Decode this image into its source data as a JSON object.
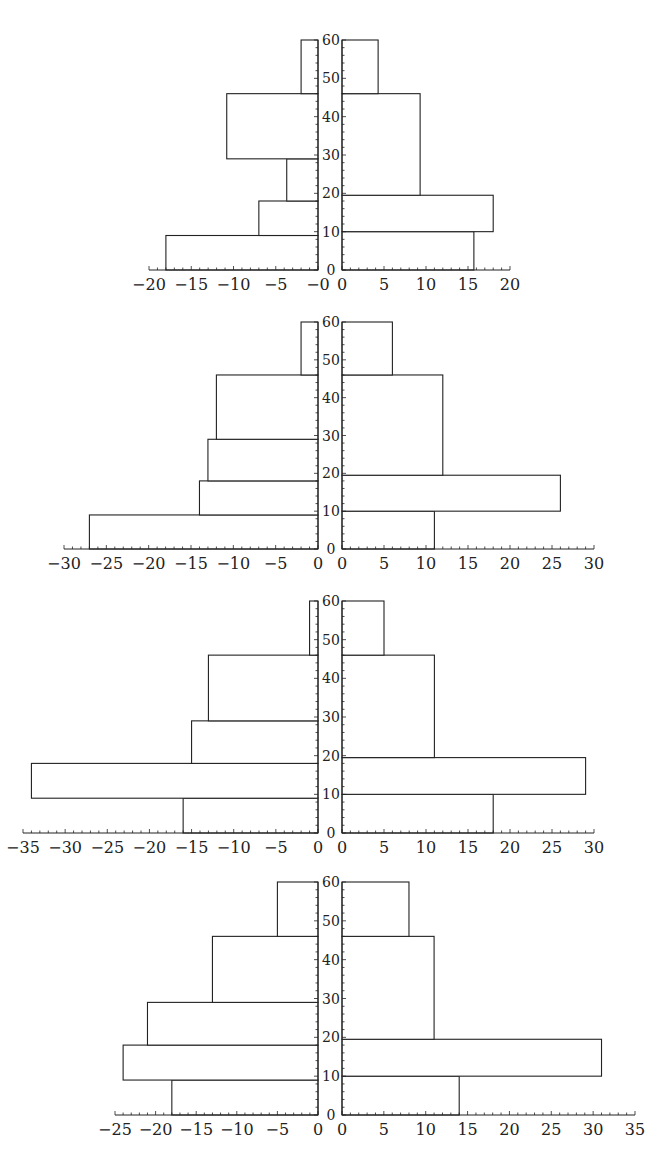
{
  "chart_data": [
    {
      "type": "bar",
      "orientation": "horizontal-butterfly",
      "title": "",
      "y_axis": {
        "range": [
          0,
          60
        ],
        "ticks": [
          0,
          10,
          20,
          30,
          40,
          50,
          60
        ],
        "minor_step": 2
      },
      "left": {
        "xlim": [
          -20,
          0
        ],
        "ticks": [
          -20,
          -15,
          -10,
          -5,
          0
        ],
        "tick_labels": [
          "−20",
          "−15",
          "−10",
          "−5",
          "−0"
        ],
        "bars": [
          {
            "y0": 0,
            "y1": 9,
            "value": -18
          },
          {
            "y0": 9,
            "y1": 18,
            "value": -7
          },
          {
            "y0": 18,
            "y1": 29,
            "value": -3.7
          },
          {
            "y0": 29,
            "y1": 46,
            "value": -10.8
          },
          {
            "y0": 46,
            "y1": 60,
            "value": -2
          }
        ]
      },
      "right": {
        "xlim": [
          0,
          20
        ],
        "ticks": [
          0,
          5,
          10,
          15,
          20
        ],
        "tick_labels": [
          "0",
          "5",
          "10",
          "15",
          "20"
        ],
        "bars": [
          {
            "y0": 0,
            "y1": 10,
            "value": 15.7
          },
          {
            "y0": 10,
            "y1": 19.5,
            "value": 18
          },
          {
            "y0": 19.5,
            "y1": 46,
            "value": 9.3
          },
          {
            "y0": 46,
            "y1": 60,
            "value": 4.3
          }
        ]
      },
      "layout": {
        "top": 40,
        "bottom": 270,
        "left_x0": 149,
        "left_x1": 318,
        "right_x0": 342,
        "right_x1": 510
      }
    },
    {
      "type": "bar",
      "orientation": "horizontal-butterfly",
      "title": "",
      "y_axis": {
        "range": [
          0,
          60
        ],
        "ticks": [
          0,
          10,
          20,
          30,
          40,
          50,
          60
        ],
        "minor_step": 2
      },
      "left": {
        "xlim": [
          -30,
          0
        ],
        "ticks": [
          -30,
          -25,
          -20,
          -15,
          -10,
          -5,
          0
        ],
        "tick_labels": [
          "−30",
          "−25",
          "−20",
          "−15",
          "−10",
          "−5",
          "0"
        ],
        "bars": [
          {
            "y0": 0,
            "y1": 9,
            "value": -27
          },
          {
            "y0": 9,
            "y1": 18,
            "value": -14
          },
          {
            "y0": 18,
            "y1": 29,
            "value": -13
          },
          {
            "y0": 29,
            "y1": 46,
            "value": -12
          },
          {
            "y0": 46,
            "y1": 60,
            "value": -2
          }
        ]
      },
      "right": {
        "xlim": [
          0,
          30
        ],
        "ticks": [
          0,
          5,
          10,
          15,
          20,
          25,
          30
        ],
        "tick_labels": [
          "0",
          "5",
          "10",
          "15",
          "20",
          "25",
          "30"
        ],
        "bars": [
          {
            "y0": 0,
            "y1": 10,
            "value": 11
          },
          {
            "y0": 10,
            "y1": 19.5,
            "value": 26
          },
          {
            "y0": 19.5,
            "y1": 46,
            "value": 12
          },
          {
            "y0": 46,
            "y1": 60,
            "value": 6
          }
        ]
      },
      "layout": {
        "top": 322,
        "bottom": 549,
        "left_x0": 64,
        "left_x1": 318,
        "right_x0": 342,
        "right_x1": 594
      }
    },
    {
      "type": "bar",
      "orientation": "horizontal-butterfly",
      "title": "",
      "y_axis": {
        "range": [
          0,
          60
        ],
        "ticks": [
          0,
          10,
          20,
          30,
          40,
          50,
          60
        ],
        "minor_step": 2
      },
      "left": {
        "xlim": [
          -35,
          0
        ],
        "ticks": [
          -35,
          -30,
          -25,
          -20,
          -15,
          -10,
          -5,
          0
        ],
        "tick_labels": [
          "−35",
          "−30",
          "−25",
          "−20",
          "−15",
          "−10",
          "−5",
          "0"
        ],
        "bars": [
          {
            "y0": 0,
            "y1": 9,
            "value": -16
          },
          {
            "y0": 9,
            "y1": 18,
            "value": -34
          },
          {
            "y0": 18,
            "y1": 29,
            "value": -15
          },
          {
            "y0": 29,
            "y1": 46,
            "value": -13
          },
          {
            "y0": 46,
            "y1": 60,
            "value": -1
          }
        ]
      },
      "right": {
        "xlim": [
          0,
          30
        ],
        "ticks": [
          0,
          5,
          10,
          15,
          20,
          25,
          30
        ],
        "tick_labels": [
          "0",
          "5",
          "10",
          "15",
          "20",
          "25",
          "30"
        ],
        "bars": [
          {
            "y0": 0,
            "y1": 10,
            "value": 18
          },
          {
            "y0": 10,
            "y1": 19.5,
            "value": 29
          },
          {
            "y0": 19.5,
            "y1": 46,
            "value": 11
          },
          {
            "y0": 46,
            "y1": 60,
            "value": 5
          }
        ]
      },
      "layout": {
        "top": 601,
        "bottom": 833,
        "left_x0": 23,
        "left_x1": 318,
        "right_x0": 342,
        "right_x1": 594
      }
    },
    {
      "type": "bar",
      "orientation": "horizontal-butterfly",
      "title": "",
      "y_axis": {
        "range": [
          0,
          60
        ],
        "ticks": [
          0,
          10,
          20,
          30,
          40,
          50,
          60
        ],
        "minor_step": 2
      },
      "left": {
        "xlim": [
          -25,
          0
        ],
        "ticks": [
          -25,
          -20,
          -15,
          -10,
          -5,
          0
        ],
        "tick_labels": [
          "−25",
          "−20",
          "−15",
          "−10",
          "−5",
          "0"
        ],
        "bars": [
          {
            "y0": 0,
            "y1": 9,
            "value": -18
          },
          {
            "y0": 9,
            "y1": 18,
            "value": -24
          },
          {
            "y0": 18,
            "y1": 29,
            "value": -21
          },
          {
            "y0": 29,
            "y1": 46,
            "value": -13
          },
          {
            "y0": 46,
            "y1": 60,
            "value": -5
          }
        ]
      },
      "right": {
        "xlim": [
          0,
          35
        ],
        "ticks": [
          0,
          5,
          10,
          15,
          20,
          25,
          30,
          35
        ],
        "tick_labels": [
          "0",
          "5",
          "10",
          "15",
          "20",
          "25",
          "30",
          "35"
        ],
        "bars": [
          {
            "y0": 0,
            "y1": 10,
            "value": 14
          },
          {
            "y0": 10,
            "y1": 19.5,
            "value": 31
          },
          {
            "y0": 19.5,
            "y1": 46,
            "value": 11
          },
          {
            "y0": 46,
            "y1": 60,
            "value": 8
          }
        ]
      },
      "layout": {
        "top": 882,
        "bottom": 1115,
        "left_x0": 115,
        "left_x1": 318,
        "right_x0": 342,
        "right_x1": 635
      }
    }
  ],
  "style": {
    "stroke": "#222222",
    "fill": "#ffffff",
    "background": "#ffffff"
  }
}
